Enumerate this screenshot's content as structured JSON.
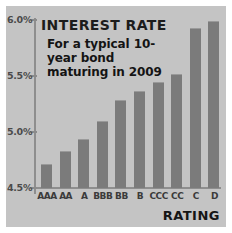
{
  "figure": {
    "background_color": "#c4c4c4",
    "bar_color": "#7b7b7b",
    "axis_color": "#8e8e8e",
    "text_color": "#1c1c1c"
  },
  "chart_data": {
    "type": "bar",
    "title": "INTEREST RATE",
    "subtitle": "For a typical 10-year bond maturing in 2009",
    "xlabel": "RATING",
    "ylabel": "",
    "categories": [
      "AAA",
      "AA",
      "A",
      "BBB",
      "BB",
      "B",
      "CCC",
      "CC",
      "C",
      "D"
    ],
    "values": [
      4.71,
      4.83,
      4.94,
      5.1,
      5.29,
      5.37,
      5.45,
      5.52,
      5.93,
      5.99
    ],
    "ylim": [
      4.5,
      6.0
    ],
    "yticks": [
      4.5,
      5.0,
      5.5,
      6.0
    ],
    "ytick_labels": [
      "4.5%",
      "5.0%",
      "5.5%",
      "6.0%"
    ],
    "grid": false,
    "legend": null
  }
}
